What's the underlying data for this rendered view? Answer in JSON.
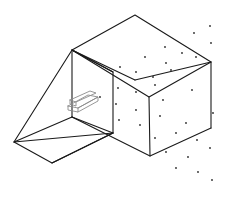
{
  "figure": {
    "caption_fragment": "Figure",
    "type": "technical-line-drawing",
    "projection": "isometric",
    "background_color": "#ffffff",
    "line_color": "#1a1a1a",
    "detail_line_color": "#8c8c8c",
    "dot_color": "#2b2b2b",
    "line_width": 1.1,
    "detail_line_width": 0.9,
    "canvas": {
      "width": 225,
      "height": 200
    }
  },
  "box": {
    "name": "open-top-box",
    "vertices": {
      "top_back": [
        135,
        15
      ],
      "top_left": [
        72,
        50
      ],
      "top_right": [
        211,
        62
      ],
      "top_front": [
        149,
        97
      ],
      "bottom_left": [
        72,
        117
      ],
      "bottom_right": [
        211,
        128
      ],
      "bottom_front": [
        150,
        156
      ],
      "bottom_back": [
        135,
        80
      ]
    },
    "top_rim_path": "135,15 72,50 149,97 211,62 135,15",
    "verticals": [
      {
        "name": "left-vertical-edge",
        "from": [
          72,
          50
        ],
        "to": [
          72,
          117
        ]
      },
      {
        "name": "front-vertical-edge",
        "from": [
          149,
          97
        ],
        "to": [
          150,
          156
        ]
      },
      {
        "name": "right-vertical-edge",
        "from": [
          211,
          62
        ],
        "to": [
          211,
          128
        ]
      }
    ],
    "bottom_path": "72,117 150,156 211,128",
    "inner_back_edge": {
      "from": [
        72,
        50
      ],
      "to": [
        135,
        80
      ]
    },
    "inner_right_edge": {
      "from": [
        135,
        80
      ],
      "to": [
        211,
        62
      ]
    }
  },
  "ramp": {
    "name": "triangular-ramp-wedge",
    "vertices": {
      "apex_top": [
        72,
        50
      ],
      "apex_inner": [
        113,
        72
      ],
      "left_point": [
        14,
        142
      ],
      "bottom_point": [
        52,
        163
      ],
      "base_right": [
        113,
        133
      ],
      "mid_right": [
        72,
        117
      ]
    },
    "paths": [
      "72,50 14,142 52,163 113,133 113,72 72,50",
      "72,50 113,72",
      "14,142 113,133",
      "72,117 14,142",
      "72,117 113,133",
      "52,163 113,133"
    ]
  },
  "detail_arrow": {
    "name": "small-gray-plate-detail",
    "color": "#8c8c8c",
    "anchor": [
      80,
      100
    ],
    "paths": [
      "68,106 88,95 98,97 78,108 68,106",
      "68,106 68,110 78,112 78,108",
      "78,108 98,97 98,101 78,112",
      "70,100 90,91 96,93 76,102 70,100",
      "70,100 70,104 76,106 76,102"
    ]
  },
  "stipple_dots": {
    "name": "stipple-texture-dots",
    "count": 34,
    "radius": 0.9,
    "points": [
      [
        210,
        26
      ],
      [
        194,
        33
      ],
      [
        211,
        43
      ],
      [
        165,
        47
      ],
      [
        182,
        53
      ],
      [
        145,
        57
      ],
      [
        166,
        63
      ],
      [
        196,
        57
      ],
      [
        120,
        67
      ],
      [
        136,
        72
      ],
      [
        153,
        77
      ],
      [
        171,
        70
      ],
      [
        118,
        88
      ],
      [
        136,
        92
      ],
      [
        155,
        85
      ],
      [
        192,
        90
      ],
      [
        100,
        97
      ],
      [
        116,
        104
      ],
      [
        136,
        110
      ],
      [
        163,
        100
      ],
      [
        119,
        120
      ],
      [
        140,
        125
      ],
      [
        160,
        116
      ],
      [
        186,
        123
      ],
      [
        213,
        113
      ],
      [
        155,
        138
      ],
      [
        176,
        133
      ],
      [
        197,
        140
      ],
      [
        166,
        152
      ],
      [
        188,
        157
      ],
      [
        210,
        148
      ],
      [
        176,
        168
      ],
      [
        198,
        172
      ],
      [
        212,
        180
      ]
    ]
  }
}
